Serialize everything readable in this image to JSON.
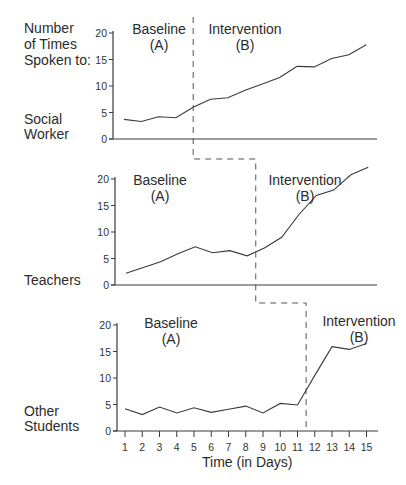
{
  "chart_data": [
    {
      "type": "line",
      "title": "Social Worker",
      "ylabel": "Number of Times Spoken to:",
      "xlabel": "Time (in Days)",
      "x": [
        1,
        2,
        3,
        4,
        5,
        6,
        7,
        8,
        9,
        10,
        11,
        12,
        13,
        14,
        15
      ],
      "series": [
        {
          "name": "Social Worker",
          "values": [
            3.7,
            3.3,
            4.2,
            4.0,
            6.0,
            7.5,
            7.8,
            9.2,
            10.4,
            11.6,
            13.7,
            13.6,
            15.2,
            15.9,
            17.8
          ]
        }
      ],
      "ylim": [
        0,
        20
      ],
      "yticks": [
        0,
        5,
        10,
        15,
        20
      ],
      "phase_change_after_day": 5,
      "phases": [
        {
          "label": "Baseline",
          "code": "(A)"
        },
        {
          "label": "Intervention",
          "code": "(B)"
        }
      ]
    },
    {
      "type": "line",
      "title": "Teachers",
      "xlabel": "Time (in Days)",
      "x": [
        1,
        2,
        3,
        4,
        5,
        6,
        7,
        8,
        9,
        10,
        11,
        12,
        13,
        14,
        15
      ],
      "series": [
        {
          "name": "Teachers",
          "values": [
            2.2,
            3.3,
            4.4,
            5.9,
            7.2,
            6.1,
            6.5,
            5.5,
            7.0,
            9.0,
            13.3,
            16.9,
            17.9,
            20.8,
            22.2
          ]
        }
      ],
      "ylim": [
        0,
        20
      ],
      "yticks": [
        0,
        5,
        10,
        15,
        20
      ],
      "phase_change_after_day": 8.5,
      "phases": [
        {
          "label": "Baseline",
          "code": "(A)"
        },
        {
          "label": "Intervention",
          "code": "(B)"
        }
      ]
    },
    {
      "type": "line",
      "title": "Other Students",
      "xlabel": "Time (in Days)",
      "x": [
        1,
        2,
        3,
        4,
        5,
        6,
        7,
        8,
        9,
        10,
        11,
        12,
        13,
        14,
        15
      ],
      "series": [
        {
          "name": "Other Students",
          "values": [
            4.2,
            3.1,
            4.5,
            3.4,
            4.4,
            3.5,
            4.1,
            4.7,
            3.4,
            5.2,
            4.9,
            10.5,
            15.9,
            15.4,
            16.5
          ]
        }
      ],
      "ylim": [
        0,
        20
      ],
      "yticks": [
        0,
        5,
        10,
        15,
        20
      ],
      "phase_change_after_day": 11.5,
      "phases": [
        {
          "label": "Baseline",
          "code": "(A)"
        },
        {
          "label": "Intervention",
          "code": "(B)"
        }
      ]
    }
  ],
  "labels": {
    "y_title_line1": "Number",
    "y_title_line2": "of Times",
    "y_title_line3": "Spoken to:",
    "panel1_line1": "Social",
    "panel1_line2": "Worker",
    "panel2": "Teachers",
    "panel3_line1": "Other",
    "panel3_line2": "Students",
    "baseline": "Baseline",
    "baseline_code": "(A)",
    "intervention": "Intervention",
    "intervention_code": "(B)",
    "x_title": "Time (in Days)"
  }
}
